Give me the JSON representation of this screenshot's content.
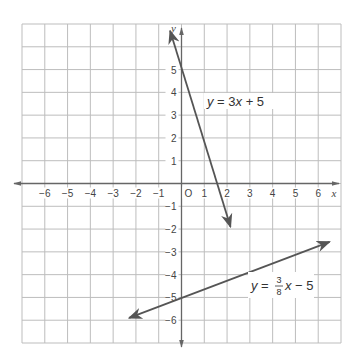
{
  "chart_data": {
    "type": "line",
    "title": "",
    "xlabel": "x",
    "ylabel": "y",
    "origin_label": "O",
    "xlim": [
      -7,
      7
    ],
    "ylim": [
      -7,
      7
    ],
    "grid": true,
    "x_ticks": [
      -6,
      -5,
      -4,
      -3,
      -2,
      -1,
      1,
      2,
      3,
      4,
      5,
      6
    ],
    "y_ticks": [
      5,
      4,
      3,
      2,
      1,
      -1,
      -2,
      -3,
      -4,
      -5,
      -6
    ],
    "series": [
      {
        "name": "y = 3x + 5",
        "label_parts": {
          "lhs": "y",
          "eq": " = 3",
          "var": "x",
          "rest": " + 5"
        },
        "drawn_points": [
          [
            -0.5,
            6.7
          ],
          [
            2.15,
            -1.9
          ]
        ],
        "y_intercept": 5,
        "arrows": "both"
      },
      {
        "name": "y = 3/8 x − 5",
        "label_parts": {
          "lhs": "y",
          "eq": " = ",
          "num": "3",
          "den": "8",
          "var": "x",
          "rest": " − 5"
        },
        "drawn_points": [
          [
            -2.3,
            -5.9
          ],
          [
            6.5,
            -2.56
          ]
        ],
        "y_intercept": -5,
        "slope": 0.375,
        "arrows": "both"
      }
    ]
  }
}
